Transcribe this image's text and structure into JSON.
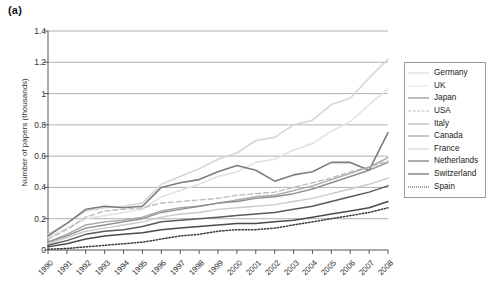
{
  "panel_label": "(a)",
  "chart_data": {
    "type": "line",
    "title": "(a)",
    "xlabel": "",
    "ylabel": "Number of papers (thousands)",
    "xlim": [
      1990,
      2008
    ],
    "ylim": [
      0,
      1.4
    ],
    "yticks": [
      0,
      0.2,
      0.4,
      0.6,
      0.8,
      1,
      1.2,
      1.4
    ],
    "ytick_labels": [
      "0",
      "0.2",
      "0.4",
      "0.6",
      "0.8",
      "1",
      "1.2",
      "1.4"
    ],
    "grid": "horizontal",
    "legend_position": "right",
    "x": [
      1990,
      1991,
      1992,
      1993,
      1994,
      1995,
      1996,
      1997,
      1998,
      1999,
      2000,
      2001,
      2002,
      2003,
      2004,
      2005,
      2006,
      2007,
      2008
    ],
    "series": [
      {
        "name": "Germany",
        "color": "#d6d6d6",
        "style": "solid",
        "width": 1.6,
        "values": [
          0.1,
          0.17,
          0.25,
          0.27,
          0.28,
          0.3,
          0.42,
          0.47,
          0.52,
          0.58,
          0.62,
          0.7,
          0.72,
          0.8,
          0.83,
          0.93,
          0.97,
          1.1,
          1.22
        ]
      },
      {
        "name": "UK",
        "color": "#e2e2e2",
        "style": "solid",
        "width": 1.6,
        "values": [
          0.08,
          0.14,
          0.2,
          0.22,
          0.24,
          0.26,
          0.34,
          0.38,
          0.42,
          0.47,
          0.5,
          0.56,
          0.58,
          0.64,
          0.68,
          0.76,
          0.82,
          0.93,
          1.03
        ]
      },
      {
        "name": "Japan",
        "color": "#7c7c7c",
        "style": "solid",
        "width": 1.6,
        "values": [
          0.09,
          0.17,
          0.26,
          0.28,
          0.27,
          0.28,
          0.4,
          0.43,
          0.45,
          0.5,
          0.54,
          0.51,
          0.44,
          0.48,
          0.5,
          0.56,
          0.56,
          0.51,
          0.75
        ]
      },
      {
        "name": "USA",
        "color": "#bdbdbd",
        "style": "dashed",
        "width": 1.4,
        "values": [
          0.07,
          0.13,
          0.21,
          0.25,
          0.26,
          0.27,
          0.3,
          0.31,
          0.32,
          0.33,
          0.35,
          0.36,
          0.37,
          0.4,
          0.43,
          0.46,
          0.5,
          0.53,
          0.57
        ]
      },
      {
        "name": "Italy",
        "color": "#a8a8a8",
        "style": "solid",
        "width": 1.4,
        "values": [
          0.05,
          0.1,
          0.16,
          0.18,
          0.19,
          0.21,
          0.25,
          0.27,
          0.28,
          0.3,
          0.32,
          0.34,
          0.35,
          0.38,
          0.41,
          0.45,
          0.49,
          0.53,
          0.59
        ]
      },
      {
        "name": "Canada",
        "color": "#8f8f8f",
        "style": "solid",
        "width": 1.4,
        "values": [
          0.05,
          0.09,
          0.14,
          0.16,
          0.18,
          0.2,
          0.24,
          0.26,
          0.28,
          0.3,
          0.31,
          0.33,
          0.34,
          0.36,
          0.39,
          0.43,
          0.47,
          0.51,
          0.56
        ]
      },
      {
        "name": "France",
        "color": "#cacaca",
        "style": "solid",
        "width": 1.4,
        "values": [
          0.04,
          0.08,
          0.12,
          0.14,
          0.16,
          0.18,
          0.21,
          0.23,
          0.24,
          0.26,
          0.27,
          0.28,
          0.29,
          0.31,
          0.33,
          0.36,
          0.39,
          0.42,
          0.46
        ]
      },
      {
        "name": "Netherlands",
        "color": "#5a5a5a",
        "style": "solid",
        "width": 1.5,
        "values": [
          0.03,
          0.06,
          0.1,
          0.12,
          0.13,
          0.15,
          0.18,
          0.19,
          0.2,
          0.21,
          0.22,
          0.23,
          0.24,
          0.26,
          0.28,
          0.31,
          0.34,
          0.37,
          0.41
        ]
      },
      {
        "name": "Switzerland",
        "color": "#4a4a4a",
        "style": "solid",
        "width": 1.5,
        "values": [
          0.02,
          0.04,
          0.07,
          0.09,
          0.1,
          0.11,
          0.13,
          0.14,
          0.15,
          0.16,
          0.17,
          0.17,
          0.18,
          0.19,
          0.21,
          0.23,
          0.25,
          0.27,
          0.31
        ]
      },
      {
        "name": "Spain",
        "color": "#3a3a3a",
        "style": "dotted",
        "width": 1.5,
        "values": [
          0.005,
          0.01,
          0.02,
          0.03,
          0.04,
          0.05,
          0.07,
          0.09,
          0.1,
          0.12,
          0.13,
          0.13,
          0.14,
          0.16,
          0.18,
          0.2,
          0.22,
          0.24,
          0.27
        ]
      }
    ]
  }
}
